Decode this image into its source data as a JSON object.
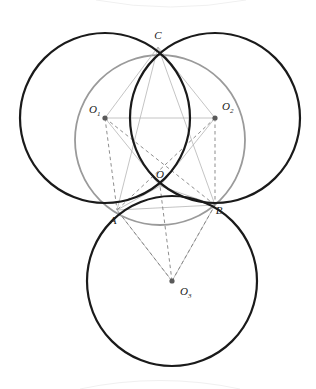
{
  "figure": {
    "background_color": "#ffffff",
    "width": 316,
    "height": 389
  },
  "chart_data": {
    "type": "scatter",
    "xlabel": "",
    "ylabel": "",
    "xlim": [
      0,
      316
    ],
    "ylim": [
      0,
      389
    ],
    "grid": false,
    "legend": null,
    "circles": [
      {
        "name": "circle-O1",
        "cx": 105,
        "cy": 118,
        "r": 85,
        "color": "#1a1a1a",
        "stroke_width": 2.2,
        "style": "solid"
      },
      {
        "name": "circle-O2",
        "cx": 215,
        "cy": 118,
        "r": 85,
        "color": "#1a1a1a",
        "stroke_width": 2.2,
        "style": "solid"
      },
      {
        "name": "circle-O3",
        "cx": 172,
        "cy": 281,
        "r": 85,
        "color": "#1a1a1a",
        "stroke_width": 2.2,
        "style": "solid"
      },
      {
        "name": "circle-O-circumscribed",
        "cx": 160,
        "cy": 140,
        "r": 85,
        "color": "#9a9a9a",
        "stroke_width": 1.8,
        "style": "solid"
      }
    ],
    "points": [
      {
        "label": "C",
        "x": 158,
        "y": 47,
        "marker": false,
        "label_dx": 0,
        "label_dy": -8
      },
      {
        "label": "O1",
        "x": 105,
        "y": 118,
        "marker": true,
        "label_dx": -16,
        "label_dy": -5
      },
      {
        "label": "O2",
        "x": 215,
        "y": 118,
        "marker": true,
        "label_dx": 7,
        "label_dy": -8
      },
      {
        "label": "O",
        "x": 160,
        "y": 186,
        "marker": false,
        "label_dx": 0,
        "label_dy": -8
      },
      {
        "label": "A",
        "x": 117,
        "y": 210,
        "marker": false,
        "label_dx": -4,
        "label_dy": 14
      },
      {
        "label": "B",
        "x": 215,
        "y": 205,
        "marker": false,
        "label_dx": 4,
        "label_dy": 9
      },
      {
        "label": "O3",
        "x": 172,
        "y": 281,
        "marker": true,
        "label_dx": 8,
        "label_dy": 14
      }
    ],
    "solid_segments": [
      {
        "name": "O1-O2",
        "from": "O1",
        "to": "O2",
        "x1": 105,
        "y1": 118,
        "x2": 215,
        "y2": 118
      },
      {
        "name": "O1-C",
        "from": "O1",
        "to": "C",
        "x1": 105,
        "y1": 118,
        "x2": 158,
        "y2": 47
      },
      {
        "name": "O2-C",
        "from": "O2",
        "to": "C",
        "x1": 215,
        "y1": 118,
        "x2": 158,
        "y2": 47
      },
      {
        "name": "O1-O",
        "from": "O1",
        "to": "O",
        "x1": 105,
        "y1": 118,
        "x2": 160,
        "y2": 186
      },
      {
        "name": "O2-O",
        "from": "O2",
        "to": "O",
        "x1": 215,
        "y1": 118,
        "x2": 160,
        "y2": 186
      },
      {
        "name": "A-B",
        "from": "A",
        "to": "B",
        "x1": 117,
        "y1": 210,
        "x2": 215,
        "y2": 205
      },
      {
        "name": "A-O",
        "from": "A",
        "to": "O",
        "x1": 117,
        "y1": 210,
        "x2": 160,
        "y2": 186
      },
      {
        "name": "B-O",
        "from": "B",
        "to": "O",
        "x1": 215,
        "y1": 205,
        "x2": 160,
        "y2": 186
      },
      {
        "name": "A-O3",
        "from": "A",
        "to": "O3",
        "x1": 117,
        "y1": 210,
        "x2": 172,
        "y2": 281
      },
      {
        "name": "B-O3",
        "from": "B",
        "to": "O3",
        "x1": 215,
        "y1": 205,
        "x2": 172,
        "y2": 281
      },
      {
        "name": "C-A",
        "from": "C",
        "to": "A",
        "x1": 158,
        "y1": 47,
        "x2": 117,
        "y2": 210
      },
      {
        "name": "C-B",
        "from": "C",
        "to": "B",
        "x1": 158,
        "y1": 47,
        "x2": 215,
        "y2": 205
      }
    ],
    "dashed_segments": [
      {
        "name": "O1-A",
        "from": "O1",
        "to": "A",
        "x1": 105,
        "y1": 118,
        "x2": 117,
        "y2": 210
      },
      {
        "name": "O1-B",
        "from": "O1",
        "to": "B",
        "x1": 105,
        "y1": 118,
        "x2": 215,
        "y2": 205
      },
      {
        "name": "O2-A",
        "from": "O2",
        "to": "A",
        "x1": 215,
        "y1": 118,
        "x2": 117,
        "y2": 210
      },
      {
        "name": "O2-B",
        "from": "O2",
        "to": "B",
        "x1": 215,
        "y1": 118,
        "x2": 215,
        "y2": 205
      },
      {
        "name": "O3-O",
        "from": "O3",
        "to": "O",
        "x1": 172,
        "y1": 281,
        "x2": 160,
        "y2": 186
      },
      {
        "name": "O3-A",
        "from": "O3",
        "to": "A",
        "x1": 172,
        "y1": 281,
        "x2": 117,
        "y2": 210
      },
      {
        "name": "O3-B",
        "from": "O3",
        "to": "B",
        "x1": 172,
        "y1": 281,
        "x2": 215,
        "y2": 205
      }
    ],
    "labels": {
      "C": "C",
      "O": "O",
      "A": "A",
      "B": "B",
      "O1_base": "O",
      "O1_sub": "1",
      "O2_base": "O",
      "O2_sub": "2",
      "O3_base": "O",
      "O3_sub": "3"
    },
    "colors": {
      "circle_black": "#1a1a1a",
      "circle_gray": "#9a9a9a",
      "segment_solid": "#b5b5b5",
      "segment_dashed": "#7a7a7a",
      "point_marker": "#5a5a5a",
      "label_text": "#1a1a1a",
      "scan_artifact": "#f2f2f2"
    }
  }
}
